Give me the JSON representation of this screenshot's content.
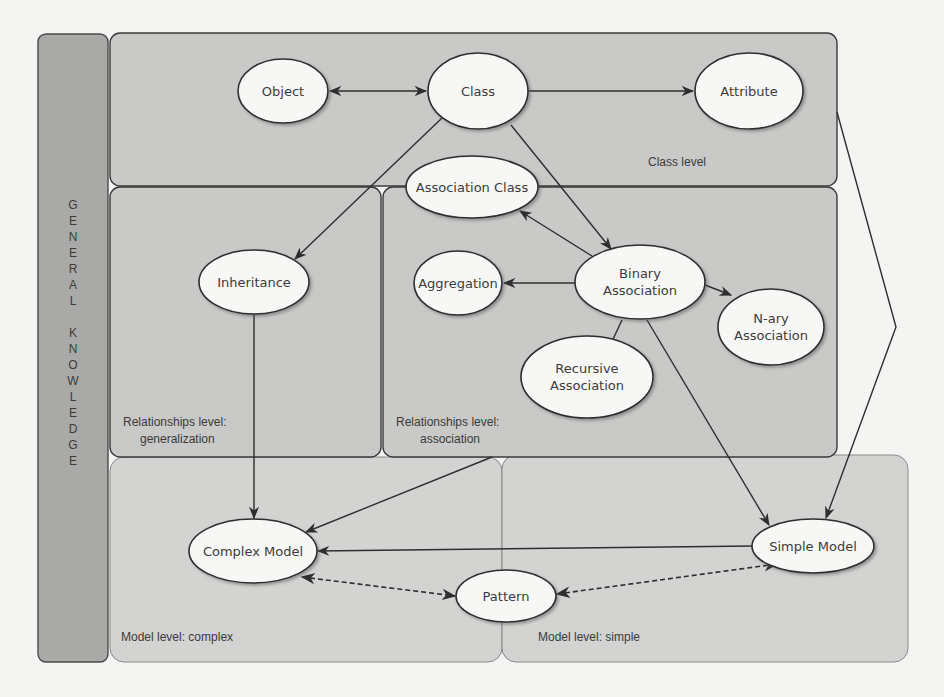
{
  "sidebar": {
    "label": "GENERAL KNOWLEDGE",
    "letters": [
      "G",
      "E",
      "N",
      "E",
      "R",
      "A",
      "L",
      "",
      "K",
      "N",
      "O",
      "W",
      "L",
      "E",
      "D",
      "G",
      "E"
    ]
  },
  "panels": {
    "class_level": "Class level",
    "relationships_generalization_line1": "Relationships level:",
    "relationships_generalization_line2": "generalization",
    "relationships_association_line1": "Relationships level:",
    "relationships_association_line2": "association",
    "model_complex": "Model level: complex",
    "model_simple": "Model level: simple"
  },
  "nodes": {
    "object": "Object",
    "class": "Class",
    "attribute": "Attribute",
    "association_class": "Association Class",
    "inheritance": "Inheritance",
    "aggregation": "Aggregation",
    "binary_association_line1": "Binary",
    "binary_association_line2": "Association",
    "nary_association_line1": "N-ary",
    "nary_association_line2": "Association",
    "recursive_association_line1": "Recursive",
    "recursive_association_line2": "Association",
    "complex_model": "Complex Model",
    "pattern": "Pattern",
    "simple_model": "Simple Model"
  },
  "edges": [
    {
      "from": "Object",
      "to": "Class",
      "style": "solid",
      "direction": "both"
    },
    {
      "from": "Class",
      "to": "Attribute",
      "style": "solid",
      "direction": "forward"
    },
    {
      "from": "Class",
      "to": "Inheritance",
      "style": "solid",
      "direction": "forward"
    },
    {
      "from": "Class",
      "to": "Binary Association",
      "style": "solid",
      "direction": "forward"
    },
    {
      "from": "Binary Association",
      "to": "Association Class",
      "style": "solid",
      "direction": "forward"
    },
    {
      "from": "Binary Association",
      "to": "Aggregation",
      "style": "solid",
      "direction": "forward"
    },
    {
      "from": "Binary Association",
      "to": "N-ary Association",
      "style": "solid",
      "direction": "forward"
    },
    {
      "from": "Binary Association",
      "to": "Recursive Association",
      "style": "solid",
      "direction": "forward"
    },
    {
      "from": "Binary Association",
      "to": "Simple Model",
      "style": "solid",
      "direction": "forward"
    },
    {
      "from": "Inheritance",
      "to": "Complex Model",
      "style": "solid",
      "direction": "forward"
    },
    {
      "from": "Relationships level: association",
      "to": "Complex Model",
      "style": "solid",
      "direction": "forward"
    },
    {
      "from": "Simple Model",
      "to": "Complex Model",
      "style": "solid",
      "direction": "forward"
    },
    {
      "from": "Class level",
      "to": "Simple Model",
      "style": "solid",
      "direction": "forward"
    },
    {
      "from": "Complex Model",
      "to": "Pattern",
      "style": "dashed",
      "direction": "both"
    },
    {
      "from": "Simple Model",
      "to": "Pattern",
      "style": "dashed",
      "direction": "both"
    }
  ]
}
